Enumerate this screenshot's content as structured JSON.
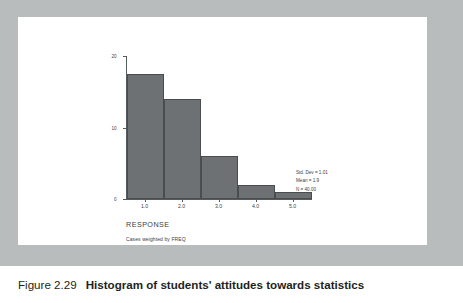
{
  "caption": {
    "figure_number": "Figure 2.29",
    "title": "Histogram of students' attitudes towards statistics"
  },
  "axis_title": "RESPONSE",
  "weight_note": "Cases weighted by FREQ",
  "statistics": {
    "std_dev": "Std. Dev = 1.01",
    "mean": "Mean = 1.9",
    "n": "N = 40.00"
  },
  "colors": {
    "bar_fill": "#6e7173",
    "bar_edge": "#4a4d4f",
    "frame": "#b9bcbd",
    "axis": "#555b5e",
    "text": "#3c4043"
  },
  "chart_data": {
    "type": "bar",
    "title": "Histogram of students' attitudes towards statistics",
    "xlabel": "RESPONSE",
    "ylabel": "",
    "categories": [
      "1.0",
      "2.0",
      "3.0",
      "4.0",
      "5.0"
    ],
    "values": [
      17.5,
      14,
      6,
      2,
      1
    ],
    "x": [
      1.0,
      2.0,
      3.0,
      4.0,
      5.0
    ],
    "bin_edges": [
      0.5,
      1.5,
      2.5,
      3.5,
      4.5,
      5.5
    ],
    "xlim": [
      0.5,
      5.5
    ],
    "ylim": [
      0,
      20
    ],
    "ytick_labels": [
      "0",
      "10",
      "20"
    ],
    "yticks": [
      0,
      10,
      20
    ],
    "xtick_labels": [
      "1.0",
      "2.0",
      "3.0",
      "4.0",
      "5.0"
    ],
    "grid": false,
    "legend": false,
    "annotations": [
      "Std. Dev = 1.01",
      "Mean = 1.9",
      "N = 40.00"
    ]
  }
}
